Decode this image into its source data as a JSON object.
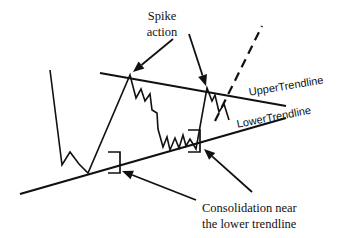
{
  "figure": {
    "background_color": "#ffffff",
    "ink_color": "#111111",
    "width": 348,
    "height": 238
  },
  "annotations": {
    "spike_label_line1": "Spike",
    "spike_label_line2": "action",
    "upper_trendline_label": "UpperTrendline",
    "lower_trendline_label": "LowerTrendline",
    "consolidation_line1": "Consolidation near",
    "consolidation_line2": "the lower trendline"
  },
  "chart_data": {
    "type": "line",
    "xlabel": "",
    "ylabel": "",
    "grid": false,
    "legend": "none",
    "xlim": [
      0,
      348
    ],
    "ylim": [
      238,
      0
    ],
    "series": [
      {
        "name": "price-action",
        "stroke": "#111111",
        "points": [
          [
            50,
            70
          ],
          [
            62,
            165
          ],
          [
            70,
            152
          ],
          [
            79,
            164
          ],
          [
            88,
            173
          ],
          [
            130,
            75
          ],
          [
            136,
            98
          ],
          [
            141,
            89
          ],
          [
            145,
            101
          ],
          [
            150,
            94
          ],
          [
            152,
            110
          ],
          [
            157,
            113
          ],
          [
            158,
            129
          ],
          [
            163,
            147
          ],
          [
            167,
            137
          ],
          [
            170,
            150
          ],
          [
            175,
            138
          ],
          [
            179,
            148
          ],
          [
            183,
            135
          ],
          [
            186,
            146
          ],
          [
            190,
            139
          ],
          [
            196,
            149
          ],
          [
            207,
            88
          ],
          [
            212,
            101
          ],
          [
            215,
            95
          ],
          [
            219,
            112
          ],
          [
            224,
            104
          ],
          [
            229,
            120
          ]
        ]
      }
    ],
    "trendlines": [
      {
        "name": "upper-trendline",
        "x1": 100,
        "y1": 73,
        "x2": 286,
        "y2": 106,
        "style": "solid",
        "label": "UpperTrendline"
      },
      {
        "name": "lower-trendline",
        "x1": 20,
        "y1": 194,
        "x2": 286,
        "y2": 118,
        "style": "solid",
        "label": "LowerTrendline"
      },
      {
        "name": "breakout-projection",
        "x1": 215,
        "y1": 121,
        "x2": 262,
        "y2": 26,
        "style": "dashed",
        "label": ""
      }
    ],
    "markers": [
      {
        "name": "consolidation-bracket-left",
        "x": 108,
        "y": 152,
        "width": 12,
        "height": 21
      },
      {
        "name": "consolidation-bracket-right",
        "x": 188,
        "y": 130,
        "width": 12,
        "height": 22
      }
    ],
    "callouts": [
      {
        "name": "spike-arrow-left",
        "from": [
          173,
          39
        ],
        "to": [
          133,
          72
        ],
        "target": "left spike peak on upper trendline"
      },
      {
        "name": "spike-arrow-right",
        "from": [
          189,
          34
        ],
        "to": [
          206,
          86
        ],
        "target": "right spike peak on upper trendline"
      },
      {
        "name": "consolidation-arrow-left",
        "from": [
          196,
          200
        ],
        "to": [
          122,
          171
        ],
        "target": "left consolidation bracket"
      },
      {
        "name": "consolidation-arrow-right",
        "from": [
          252,
          192
        ],
        "to": [
          204,
          149
        ],
        "target": "right consolidation bracket"
      }
    ]
  }
}
